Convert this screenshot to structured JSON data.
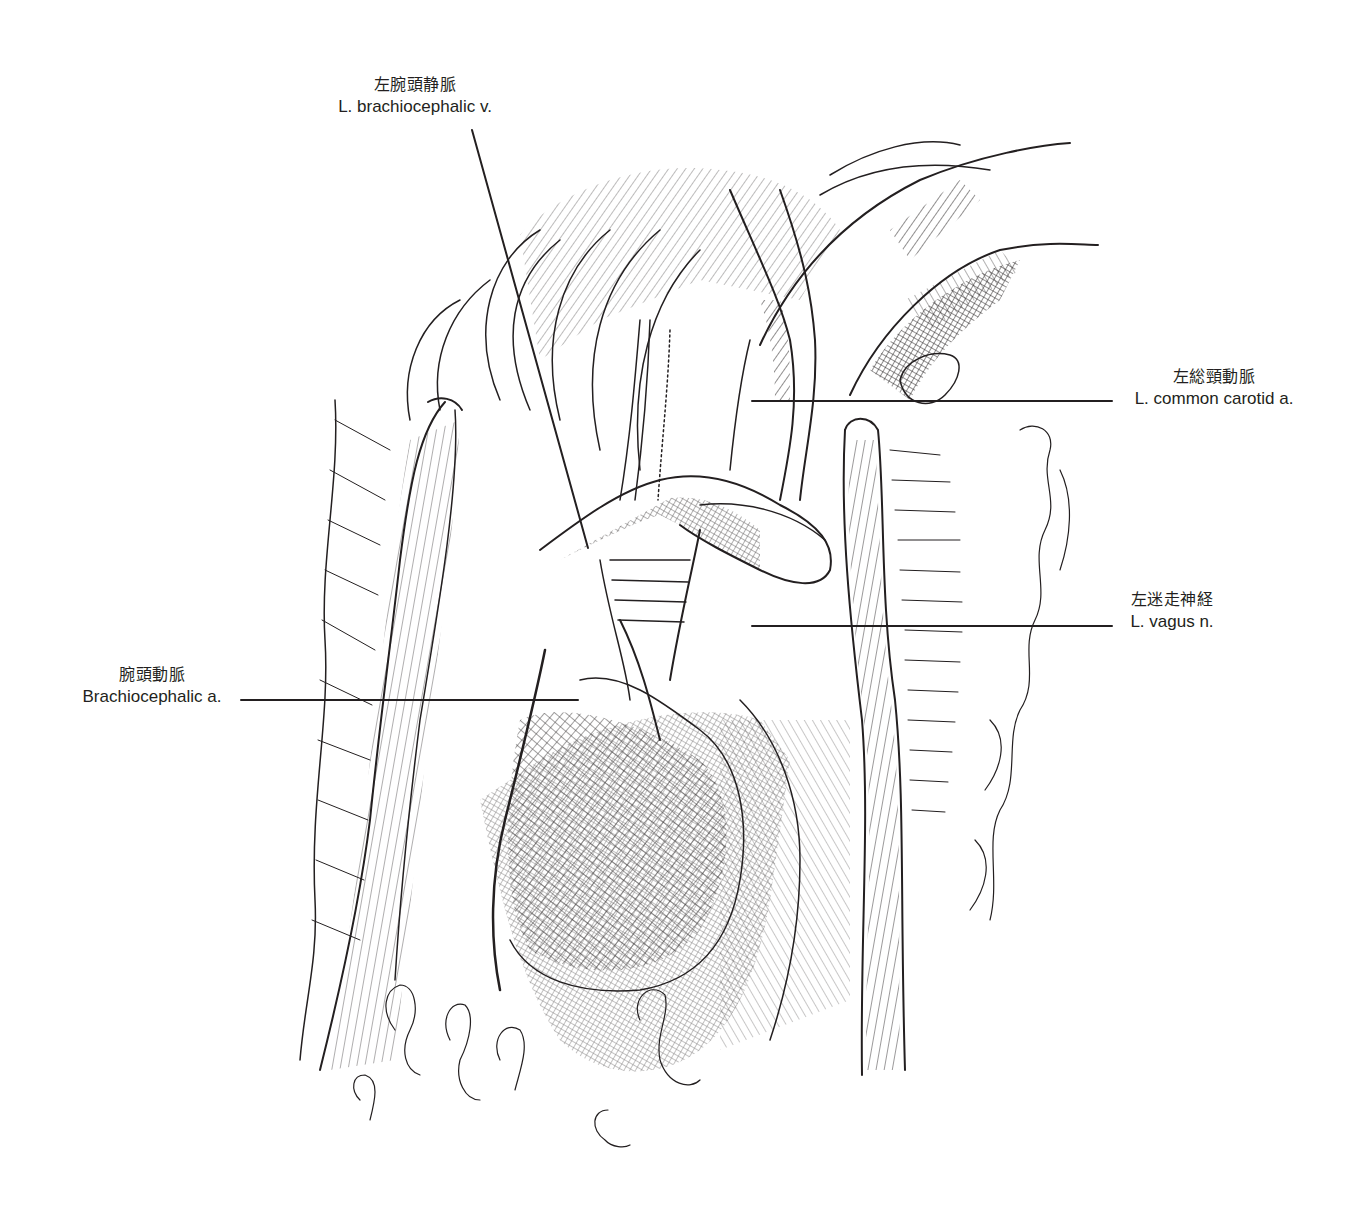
{
  "figure": {
    "type": "anatomical-illustration",
    "style": "pen-and-ink hatching",
    "line_color": "#231f20",
    "background": "#ffffff"
  },
  "labels": [
    {
      "id": "l-brachiocephalic-v",
      "ja": "左腕頭静脈",
      "en": "L. brachiocephalic v.",
      "leader": {
        "x1": 472,
        "y1": 130,
        "x2": 588,
        "y2": 548
      }
    },
    {
      "id": "l-common-carotid-a",
      "ja": "左総頸動脈",
      "en": "L. common carotid a.",
      "leader": {
        "x1": 752,
        "y1": 401,
        "x2": 1112,
        "y2": 401
      }
    },
    {
      "id": "l-vagus-n",
      "ja": "左迷走神経",
      "en": "L. vagus n.",
      "leader": {
        "x1": 752,
        "y1": 626,
        "x2": 1112,
        "y2": 626
      }
    },
    {
      "id": "brachiocephalic-a",
      "ja": "腕頭動脈",
      "en": "Brachiocephalic a.",
      "leader": {
        "x1": 241,
        "y1": 700,
        "x2": 578,
        "y2": 700
      }
    }
  ]
}
